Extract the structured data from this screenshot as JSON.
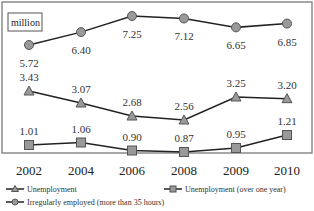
{
  "chart_data": {
    "type": "line",
    "title": "",
    "unit_label": "million",
    "xlabel": "",
    "ylabel": "million",
    "categories": [
      "2002",
      "2004",
      "2006",
      "2008",
      "2009",
      "2010"
    ],
    "series": [
      {
        "name": "Irregularly employed (more than 35 hours)",
        "marker": "circle",
        "values": [
          5.72,
          6.4,
          7.25,
          7.12,
          6.65,
          6.85
        ]
      },
      {
        "name": "Unemployment",
        "marker": "triangle",
        "values": [
          3.43,
          3.07,
          2.68,
          2.56,
          3.25,
          3.2
        ]
      },
      {
        "name": "Unemployment (over one year)",
        "marker": "square",
        "values": [
          1.01,
          1.06,
          0.9,
          0.87,
          0.95,
          1.21
        ]
      }
    ],
    "grid": false,
    "legend_position": "bottom",
    "colors": {
      "line": "#222222",
      "marker_fill": "#999999",
      "marker_stroke": "#555555",
      "frame": "#888888"
    }
  }
}
